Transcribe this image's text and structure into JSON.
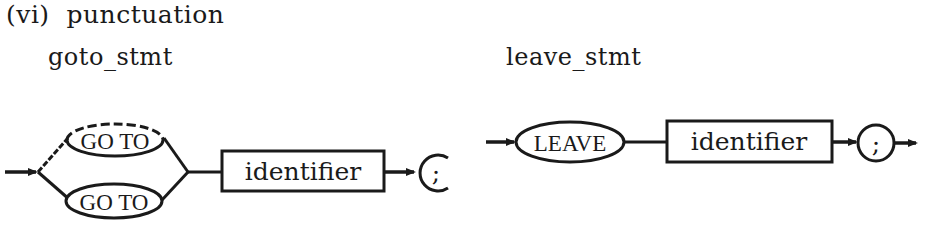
{
  "heading": "(vi)  punctuation",
  "diagrams": [
    {
      "name": "goto_stmt",
      "alternatives": [
        {
          "keyword": "GO TO",
          "style": "dashed-top"
        },
        {
          "keyword": "GO TO",
          "style": "solid"
        }
      ],
      "nonterminal": "identifier",
      "terminal": ";"
    },
    {
      "name": "leave_stmt",
      "keyword": "LEAVE",
      "nonterminal": "identifier",
      "terminal": ";"
    }
  ]
}
